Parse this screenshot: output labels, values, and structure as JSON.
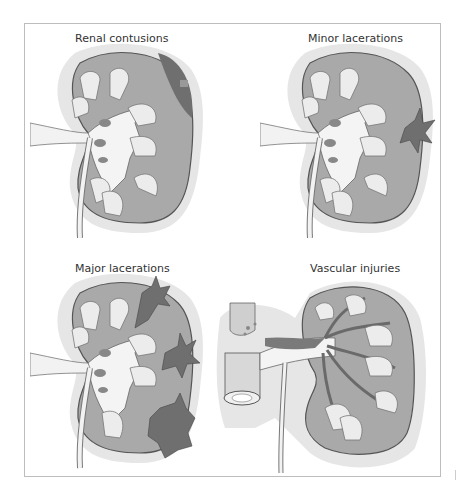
{
  "figure": {
    "panels": [
      {
        "id": "renal-contusions",
        "title": "Renal contusions"
      },
      {
        "id": "minor-lacerations",
        "title": "Minor lacerations"
      },
      {
        "id": "major-lacerations",
        "title": "Major lacerations"
      },
      {
        "id": "vascular-injuries",
        "title": "Vascular injuries"
      }
    ],
    "colors": {
      "halo": "#e6e6e6",
      "cortex": "#a9a9a9",
      "capsule": "#f2f2f2",
      "pelvis": "#f4f4f4",
      "pyramid": "#ececec",
      "injury": "#6f6f6f",
      "outline": "#555555",
      "frame": "#bdbdbd"
    }
  }
}
